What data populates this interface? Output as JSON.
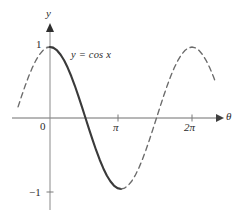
{
  "figure": {
    "name": "cosine-graph",
    "background_color": "#ffffff",
    "axis_color": "#6e6e6e",
    "curve_color": "#3a3a3a",
    "text_color": "#2b2b2b"
  },
  "labels": {
    "y_axis": "y",
    "x_axis": "θ",
    "origin": "0",
    "y_tick_positive": "1",
    "y_tick_negative": "−1",
    "x_tick_pi": "π",
    "x_tick_two_pi": "2π",
    "equation": "y = cos x"
  },
  "chart_data": {
    "type": "line",
    "title": "",
    "subtitle": "",
    "xlabel": "θ",
    "ylabel": "y",
    "grid": false,
    "legend": "none",
    "annotations": [
      {
        "text": "y = cos x",
        "x": 0.55,
        "y": 0.93,
        "style": "italic-serif"
      }
    ],
    "xlim": [
      -1.41,
      7.3
    ],
    "ylim": [
      -1.35,
      1.35
    ],
    "xticks": [
      0,
      3.14159,
      6.28319
    ],
    "xtick_labels": [
      "0",
      "π",
      "2π"
    ],
    "yticks": [
      -1,
      1
    ],
    "ytick_labels": [
      "−1",
      "1"
    ],
    "series": [
      {
        "name": "y = cos x (solid, 0 to π)",
        "style": "solid",
        "color": "#3a3a3a",
        "x": [
          0,
          0.1571,
          0.3142,
          0.4712,
          0.6283,
          0.7854,
          0.9425,
          1.0996,
          1.2566,
          1.4137,
          1.5708,
          1.7279,
          1.885,
          2.042,
          2.1991,
          2.3562,
          2.5133,
          2.6704,
          2.8274,
          2.9845,
          3.1416
        ],
        "y": [
          1,
          0.9877,
          0.9511,
          0.891,
          0.809,
          0.7071,
          0.5878,
          0.454,
          0.309,
          0.1564,
          0,
          -0.1564,
          -0.309,
          -0.454,
          -0.5878,
          -0.7071,
          -0.809,
          -0.891,
          -0.9511,
          -0.9877,
          -1
        ]
      },
      {
        "name": "y = cos x (dashed, -1.41 to 0)",
        "style": "dashed",
        "color": "#6b6b6b",
        "x": [
          -1.4137,
          -1.2566,
          -1.0996,
          -0.9425,
          -0.7854,
          -0.6283,
          -0.4712,
          -0.3142,
          -0.1571,
          0
        ],
        "y": [
          0.1564,
          0.309,
          0.454,
          0.5878,
          0.7071,
          0.809,
          0.891,
          0.9511,
          0.9877,
          1
        ]
      },
      {
        "name": "y = cos x (dashed, π to 7.3)",
        "style": "dashed",
        "color": "#6b6b6b",
        "x": [
          3.1416,
          3.2987,
          3.4558,
          3.6128,
          3.7699,
          3.927,
          4.0841,
          4.2412,
          4.3982,
          4.5553,
          4.7124,
          4.8695,
          5.0265,
          5.1836,
          5.3407,
          5.4978,
          5.6549,
          5.8119,
          5.969,
          6.1261,
          6.2832,
          6.4403,
          6.5973,
          6.7544,
          6.9115,
          7.0686,
          7.2257,
          7.3
        ],
        "y": [
          -1,
          -0.9877,
          -0.9511,
          -0.891,
          -0.809,
          -0.7071,
          -0.5878,
          -0.454,
          -0.309,
          -0.1564,
          0,
          0.1564,
          0.309,
          0.454,
          0.5878,
          0.7071,
          0.809,
          0.891,
          0.9511,
          0.9877,
          1,
          0.9877,
          0.9511,
          0.891,
          0.809,
          0.7071,
          0.5878,
          0.5225
        ]
      }
    ]
  }
}
